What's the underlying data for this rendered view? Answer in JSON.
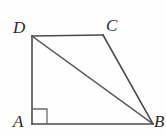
{
  "figure": {
    "background_color": "#fefefe",
    "line_color": "#4a4a4a",
    "label_color": "#2b2b2b",
    "labels": {
      "D": "D",
      "C": "C",
      "A": "A",
      "B": "B"
    },
    "vertices": {
      "A": {
        "x": 32,
        "y": 124
      },
      "B": {
        "x": 153,
        "y": 124
      },
      "C": {
        "x": 103,
        "y": 35
      },
      "D": {
        "x": 32,
        "y": 36
      }
    },
    "segments": [
      {
        "name": "AD",
        "from": "A",
        "to": "D"
      },
      {
        "name": "DC",
        "from": "D",
        "to": "C"
      },
      {
        "name": "CB",
        "from": "C",
        "to": "B"
      },
      {
        "name": "AB",
        "from": "A",
        "to": "B"
      },
      {
        "name": "DB",
        "from": "D",
        "to": "B"
      }
    ],
    "right_angle": {
      "at_vertex": "A",
      "size": 15
    }
  }
}
